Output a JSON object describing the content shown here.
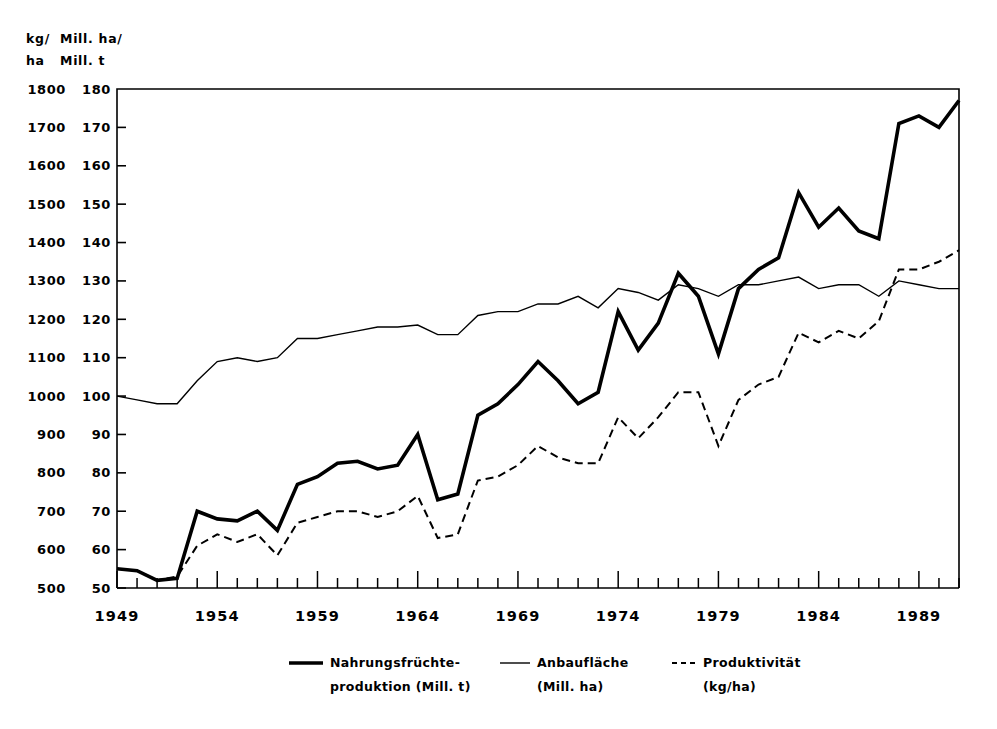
{
  "chart_data": {
    "type": "line",
    "title": "",
    "subtitle": "",
    "xlabel": "",
    "ylabel_left": "kg/\nha",
    "ylabel_right": "Mill. ha/\nMill. t",
    "grid": false,
    "legend_position": "bottom",
    "x": [
      1949,
      1950,
      1951,
      1952,
      1953,
      1954,
      1955,
      1956,
      1957,
      1958,
      1959,
      1960,
      1961,
      1962,
      1963,
      1964,
      1965,
      1966,
      1967,
      1968,
      1969,
      1970,
      1971,
      1972,
      1973,
      1974,
      1975,
      1976,
      1977,
      1978,
      1979,
      1980,
      1981,
      1982,
      1983,
      1984,
      1985,
      1986,
      1987,
      1988,
      1989,
      1990,
      1991
    ],
    "xlim": [
      1949,
      1991
    ],
    "xticks_major": [
      1949,
      1954,
      1959,
      1964,
      1969,
      1974,
      1979,
      1984,
      1989
    ],
    "xtick_labels": [
      "1949",
      "1954",
      "1959",
      "1964",
      "1969",
      "1974",
      "1979",
      "1984",
      "1989"
    ],
    "xtick_minor_every": 1,
    "left_axis": {
      "unit_label_line1": "kg/",
      "unit_label_line2": "ha",
      "ticks": [
        500,
        600,
        700,
        800,
        900,
        1000,
        1100,
        1200,
        1300,
        1400,
        1500,
        1600,
        1700,
        1800
      ],
      "tick_labels": [
        "500",
        "600",
        "700",
        "800",
        "900",
        "1000",
        "1100",
        "1200",
        "1300",
        "1400",
        "1500",
        "1600",
        "1700",
        "1800"
      ],
      "ylim": [
        500,
        1800
      ]
    },
    "right_axis": {
      "unit_label_line1": "Mill. ha/",
      "unit_label_line2": "Mill. t",
      "ticks": [
        50,
        60,
        70,
        80,
        90,
        100,
        110,
        120,
        130,
        140,
        150,
        160,
        170,
        180
      ],
      "tick_labels": [
        "50",
        "60",
        "70",
        "80",
        "90",
        "100",
        "110",
        "120",
        "130",
        "140",
        "150",
        "160",
        "170",
        "180"
      ],
      "ylim": [
        50,
        180
      ]
    },
    "series": [
      {
        "name": "Nahrungsfruechte-produktion",
        "legend_label_line1": "Nahrungsfrüchte-",
        "legend_label_line2": "produktion (Mill. t)",
        "unit": "Mill. t",
        "axis": "right",
        "style": "solid-thick",
        "color": "#000000",
        "width": 3.6,
        "values": [
          55,
          54.5,
          52,
          52.5,
          70,
          68,
          67.5,
          70,
          65,
          77,
          79,
          82.5,
          83,
          81,
          82,
          90,
          73,
          74.5,
          95,
          98,
          103,
          109,
          104,
          98,
          101,
          122,
          112,
          119,
          132,
          126,
          111,
          128,
          133,
          136,
          153,
          144,
          149,
          143,
          141,
          171,
          173,
          170,
          177
        ]
      },
      {
        "name": "Anbauflaeche",
        "legend_label_line1": "Anbaufläche",
        "legend_label_line2": "(Mill. ha)",
        "unit": "Mill. ha",
        "axis": "right",
        "style": "solid-thin",
        "color": "#000000",
        "width": 1.4,
        "values": [
          100,
          99,
          98,
          98,
          104,
          109,
          110,
          109,
          110,
          115,
          115,
          116,
          117,
          118,
          118,
          118.5,
          116,
          116,
          121,
          122,
          122,
          124,
          124,
          126,
          123,
          128,
          127,
          125,
          129,
          128,
          126,
          129,
          129,
          130,
          131,
          128,
          129,
          129,
          126,
          130,
          129,
          128,
          128
        ]
      },
      {
        "name": "Produktivitaet",
        "legend_label_line1": "Produktivität",
        "legend_label_line2": "(kg/ha)",
        "unit": "kg/ha",
        "axis": "left",
        "style": "dashed",
        "color": "#000000",
        "width": 2.0,
        "values": [
          550,
          545,
          520,
          530,
          610,
          640,
          620,
          640,
          585,
          670,
          685,
          700,
          700,
          685,
          700,
          740,
          630,
          640,
          780,
          790,
          820,
          870,
          840,
          825,
          825,
          945,
          890,
          945,
          1010,
          1010,
          870,
          990,
          1030,
          1050,
          1165,
          1140,
          1170,
          1150,
          1195,
          1330,
          1330,
          1350,
          1380
        ]
      }
    ]
  },
  "legend": {
    "items": [
      {
        "label1": "Nahrungsfrüchte-",
        "label2": "produktion (Mill. t)",
        "style": "solid-thick"
      },
      {
        "label1": "Anbaufläche",
        "label2": "(Mill. ha)",
        "style": "solid-thin"
      },
      {
        "label1": "Produktivität",
        "label2": "(kg/ha)",
        "style": "dashed"
      }
    ]
  }
}
